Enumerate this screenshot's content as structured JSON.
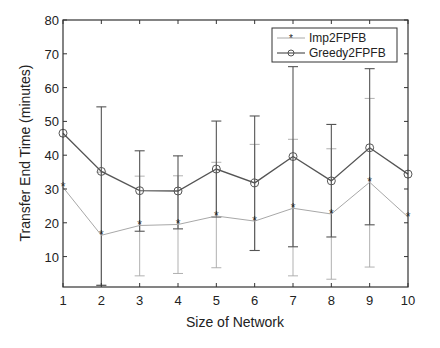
{
  "chart_data": {
    "type": "line",
    "title": "",
    "xlabel": "Size of Network",
    "ylabel": "Transfer End Time (minutes)",
    "x": [
      1,
      2,
      3,
      4,
      5,
      6,
      7,
      8,
      9,
      10
    ],
    "xlim": [
      1,
      10
    ],
    "ylim": [
      1,
      80
    ],
    "yticks": [
      10,
      20,
      30,
      40,
      50,
      60,
      70,
      80
    ],
    "xticks": [
      1,
      2,
      3,
      4,
      5,
      6,
      7,
      8,
      9,
      10
    ],
    "grid": false,
    "legend_position": "upper right",
    "series": [
      {
        "name": "Imp2FPFB",
        "marker": "asterisk",
        "color": "#a8a8a8",
        "values": [
          30.5,
          16.3,
          19.2,
          19.5,
          22.0,
          20.5,
          24.3,
          22.6,
          32.0,
          21.7
        ],
        "error_upper": [
          null,
          35.0,
          33.8,
          33.9,
          37.9,
          43.2,
          44.7,
          41.9,
          56.8,
          null
        ],
        "error_lower": [
          null,
          1.5,
          4.3,
          5.0,
          6.7,
          11.8,
          4.3,
          3.3,
          6.9,
          null
        ]
      },
      {
        "name": "Greedy2FPFB",
        "marker": "circle",
        "color": "#555555",
        "values": [
          46.5,
          35.2,
          29.5,
          29.4,
          35.9,
          31.8,
          39.6,
          32.4,
          42.2,
          34.4
        ],
        "error_upper": [
          null,
          54.3,
          41.3,
          39.8,
          50.1,
          51.6,
          66.2,
          49.1,
          65.6,
          null
        ],
        "error_lower": [
          null,
          1.5,
          17.5,
          18.2,
          21.7,
          11.8,
          12.9,
          15.8,
          19.4,
          null
        ]
      }
    ]
  },
  "legend": {
    "items": [
      {
        "label": "Imp2FPFB"
      },
      {
        "label": "Greedy2FPFB"
      }
    ]
  },
  "axes": {
    "xlabel": "Size of Network",
    "ylabel": "Transfer End Time (minutes)"
  }
}
